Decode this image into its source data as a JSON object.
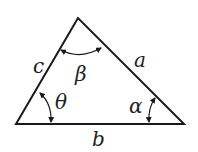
{
  "diagram": {
    "type": "triangle",
    "vertices": {
      "apex": [
        78,
        18
      ],
      "bottom_left": [
        16,
        124
      ],
      "bottom_right": [
        184,
        124
      ]
    },
    "sides": {
      "a": "a",
      "b": "b",
      "c": "c"
    },
    "angles": {
      "beta": "β",
      "theta": "θ",
      "alpha": "α"
    },
    "stroke_color": "#1a1a1a",
    "label_color": "#222222"
  }
}
